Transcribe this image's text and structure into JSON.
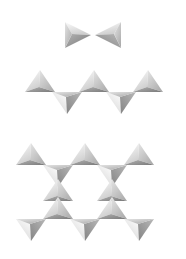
{
  "figure": {
    "background_color": "#ffffff",
    "width": 186,
    "height": 259
  },
  "palette": {
    "face_light": "#f2f2f2",
    "face_mid_light": "#d8d8d8",
    "face_mid": "#bdbdbd",
    "face_dark": "#9a9a9a",
    "face_darkest": "#7e7e7e",
    "edge_highlight": "#fbfbfb",
    "background": "#ffffff"
  },
  "panels": [
    {
      "id": "panel-dimer",
      "label": "dimer",
      "tetrahedra_count": 2,
      "shared_corners": 1,
      "center_x": 93,
      "center_y": 35,
      "unit": 21,
      "units": [
        {
          "name": "tetra-dimer-left",
          "cx": 76,
          "cy": 35,
          "orientation": "right-pointing",
          "size": 1.0
        },
        {
          "name": "tetra-dimer-right",
          "cx": 110,
          "cy": 35,
          "orientation": "left-pointing",
          "size": 1.0
        }
      ]
    },
    {
      "id": "panel-chain",
      "label": "chain",
      "tetrahedra_count": 5,
      "shared_corners": 4,
      "center_x": 93,
      "center_y": 93,
      "unit": 21,
      "units": [
        {
          "name": "tetra-chain-1",
          "cx": 40,
          "cy": 83,
          "orientation": "up",
          "size": 1.0
        },
        {
          "name": "tetra-chain-2",
          "cx": 67,
          "cy": 101,
          "orientation": "down",
          "size": 1.0
        },
        {
          "name": "tetra-chain-3",
          "cx": 94,
          "cy": 83,
          "orientation": "up",
          "size": 1.0
        },
        {
          "name": "tetra-chain-4",
          "cx": 121,
          "cy": 101,
          "orientation": "down",
          "size": 1.0
        },
        {
          "name": "tetra-chain-5",
          "cx": 148,
          "cy": 83,
          "orientation": "up",
          "size": 1.0
        }
      ]
    },
    {
      "id": "panel-lattice",
      "label": "lattice",
      "tetrahedra_count": 14,
      "hexagonal_voids": 2,
      "center_x": 93,
      "center_y": 190,
      "unit": 21,
      "units": [
        {
          "name": "tetra-lattice-r1-1",
          "cx": 31,
          "cy": 156,
          "orientation": "up",
          "size": 1.0
        },
        {
          "name": "tetra-lattice-r1-2",
          "cx": 58,
          "cy": 174,
          "orientation": "down",
          "size": 1.0
        },
        {
          "name": "tetra-lattice-r1-3",
          "cx": 85,
          "cy": 156,
          "orientation": "up",
          "size": 1.0
        },
        {
          "name": "tetra-lattice-r1-4",
          "cx": 112,
          "cy": 174,
          "orientation": "down",
          "size": 1.0
        },
        {
          "name": "tetra-lattice-r1-5",
          "cx": 139,
          "cy": 156,
          "orientation": "up",
          "size": 1.0
        },
        {
          "name": "tetra-lattice-r2-1",
          "cx": 58,
          "cy": 192,
          "orientation": "up",
          "size": 1.0
        },
        {
          "name": "tetra-lattice-r2-2",
          "cx": 112,
          "cy": 192,
          "orientation": "up",
          "size": 1.0
        },
        {
          "name": "tetra-lattice-r3-1",
          "cx": 31,
          "cy": 228,
          "orientation": "down",
          "size": 1.0
        },
        {
          "name": "tetra-lattice-r3-2",
          "cx": 58,
          "cy": 210,
          "orientation": "up",
          "size": 1.0
        },
        {
          "name": "tetra-lattice-r3-3",
          "cx": 85,
          "cy": 228,
          "orientation": "down",
          "size": 1.0
        },
        {
          "name": "tetra-lattice-r3-4",
          "cx": 112,
          "cy": 210,
          "orientation": "up",
          "size": 1.0
        },
        {
          "name": "tetra-lattice-r3-5",
          "cx": 139,
          "cy": 228,
          "orientation": "down",
          "size": 1.0
        }
      ]
    }
  ]
}
